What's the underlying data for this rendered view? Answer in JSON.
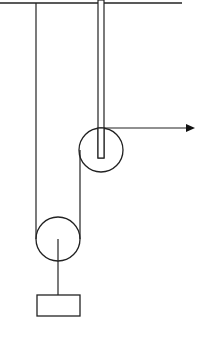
{
  "diagram": {
    "type": "pulley-system",
    "colors": {
      "stroke": "#222222",
      "background": "#ffffff"
    },
    "ceiling": {
      "x1": 0,
      "x2": 182,
      "y": 3
    },
    "fixed_rope": {
      "x": 36,
      "y1": 3,
      "y2": 238
    },
    "rod": {
      "x": 98,
      "width": 6,
      "y1": 0,
      "y2": 158
    },
    "upper_pulley": {
      "cx": 101,
      "cy": 150,
      "r": 22
    },
    "lower_pulley": {
      "cx": 58,
      "cy": 239,
      "r": 22
    },
    "pull_rope": {
      "x1": 101,
      "x2": 194,
      "y": 128
    },
    "mass": {
      "x": 37,
      "y": 295,
      "width": 43,
      "height": 21
    }
  }
}
